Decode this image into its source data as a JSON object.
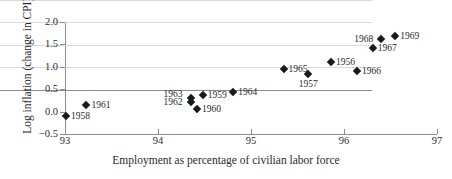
{
  "chart_data": {
    "type": "scatter",
    "title": "",
    "xlabel": "Employment as percentage of civilian labor force",
    "ylabel": "Log inflation (change in CPI)",
    "xlim": [
      93,
      97
    ],
    "ylim": [
      -0.5,
      2.0
    ],
    "grid": "horizontal",
    "legend": "none",
    "xticks": [
      "93",
      "94",
      "95",
      "96",
      "97"
    ],
    "xtick_values": [
      93,
      94,
      95,
      96,
      97
    ],
    "yticks": [
      "−0.5",
      "0.0",
      "0.5",
      "1.0",
      "1.5",
      "2.0"
    ],
    "ytick_values": [
      -0.5,
      0.0,
      0.5,
      1.0,
      1.5,
      2.0
    ],
    "point_labels_are_years": true,
    "points": [
      {
        "label": "1958",
        "x": 93.01,
        "y": -0.09,
        "label_pos": "right"
      },
      {
        "label": "1961",
        "x": 93.23,
        "y": 0.14,
        "label_pos": "right"
      },
      {
        "label": "1962",
        "x": 94.35,
        "y": 0.21,
        "label_pos": "left"
      },
      {
        "label": "1963",
        "x": 94.35,
        "y": 0.3,
        "label_pos": "left-up"
      },
      {
        "label": "1960",
        "x": 94.42,
        "y": 0.05,
        "label_pos": "right"
      },
      {
        "label": "1959",
        "x": 94.48,
        "y": 0.37,
        "label_pos": "right"
      },
      {
        "label": "1964",
        "x": 94.81,
        "y": 0.43,
        "label_pos": "right"
      },
      {
        "label": "1965",
        "x": 95.35,
        "y": 0.95,
        "label_pos": "right"
      },
      {
        "label": "1957",
        "x": 95.61,
        "y": 0.84,
        "label_pos": "below"
      },
      {
        "label": "1956",
        "x": 95.86,
        "y": 1.11,
        "label_pos": "right"
      },
      {
        "label": "1966",
        "x": 96.14,
        "y": 0.91,
        "label_pos": "right"
      },
      {
        "label": "1967",
        "x": 96.31,
        "y": 1.41,
        "label_pos": "right"
      },
      {
        "label": "1968",
        "x": 96.4,
        "y": 1.62,
        "label_pos": "left"
      },
      {
        "label": "1969",
        "x": 96.55,
        "y": 1.69,
        "label_pos": "right"
      }
    ]
  }
}
